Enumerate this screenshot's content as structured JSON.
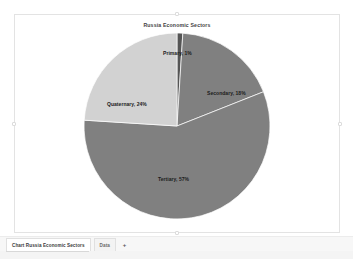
{
  "app": {
    "background_color": "#ffffff"
  },
  "chart_object": {
    "selected": true,
    "handles": [
      "top-middle",
      "middle-left",
      "middle-right",
      "bottom-middle"
    ]
  },
  "chart_data": {
    "type": "pie",
    "title": "Russia Economic Sectors",
    "xlabel": "",
    "ylabel": "",
    "legend_position": "none",
    "data_labels": "category-name-and-percentage",
    "start_angle_deg": 0,
    "direction": "clockwise",
    "grid": false,
    "categories": [
      "Primary",
      "Secondary",
      "Tertiary",
      "Quaternary"
    ],
    "values": [
      1,
      18,
      57,
      24
    ],
    "unit": "%",
    "slices": [
      {
        "label": "Primary",
        "value": 1,
        "data_label": "Primary, 1%",
        "color": "#555555"
      },
      {
        "label": "Secondary",
        "value": 18,
        "data_label": "Secondary, 18%",
        "color": "#808080"
      },
      {
        "label": "Tertiary",
        "value": 57,
        "data_label": "Tertiary, 57%",
        "color": "#808080"
      },
      {
        "label": "Quaternary",
        "value": 24,
        "data_label": "Quaternary, 24%",
        "color": "#d2d2d2"
      }
    ]
  },
  "sheet_bar": {
    "tabs": [
      {
        "label": "Chart Russia Economic Sectors",
        "active": true
      },
      {
        "label": "Data",
        "active": false
      }
    ],
    "add_sheet_label": "+"
  }
}
